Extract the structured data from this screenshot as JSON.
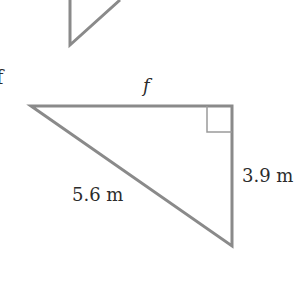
{
  "figure": {
    "upper_fragment": {
      "description": "partial triangle cut off at top"
    },
    "edge_glyph": "f",
    "triangle": {
      "labels": {
        "top_side": "f",
        "hypotenuse": "5.6 m",
        "right_side": "3.9 m"
      },
      "right_angle_marker": true,
      "stroke_color": "#8a8a8a",
      "text_color": "#2b2b2b"
    }
  }
}
